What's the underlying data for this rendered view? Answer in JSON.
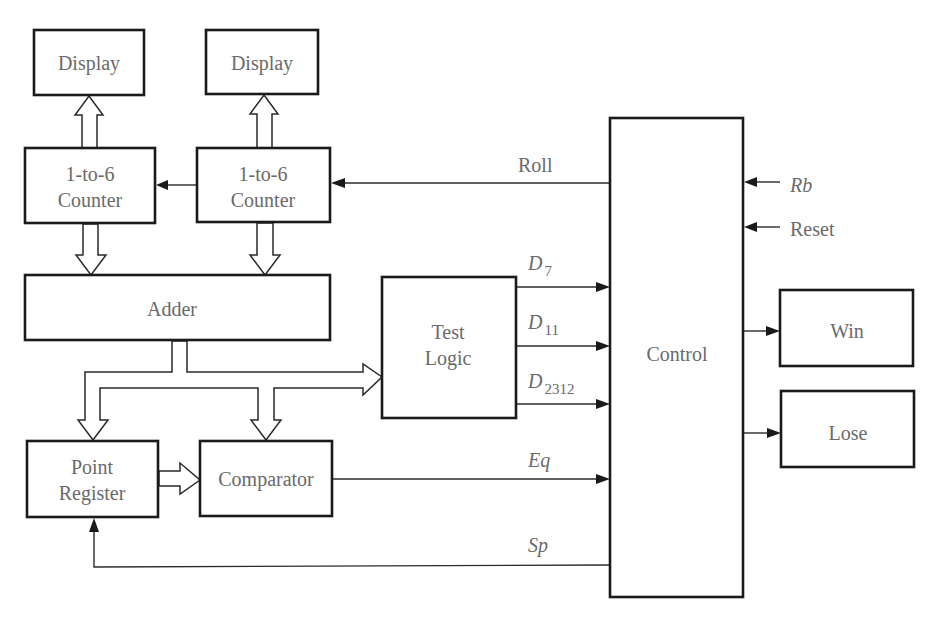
{
  "diagram": {
    "type": "block-diagram",
    "title": "",
    "blocks": {
      "display_left": {
        "label": "Display"
      },
      "display_right": {
        "label": "Display"
      },
      "counter_left": {
        "line1": "1-to-6",
        "line2": "Counter"
      },
      "counter_right": {
        "line1": "1-to-6",
        "line2": "Counter"
      },
      "adder": {
        "label": "Adder"
      },
      "test_logic": {
        "line1": "Test",
        "line2": "Logic"
      },
      "control": {
        "label": "Control"
      },
      "point_register": {
        "line1": "Point",
        "line2": "Register"
      },
      "comparator": {
        "label": "Comparator"
      },
      "win": {
        "label": "Win"
      },
      "lose": {
        "label": "Lose"
      }
    },
    "signals": {
      "roll": {
        "label": "Roll"
      },
      "rb": {
        "label": "Rb"
      },
      "reset": {
        "label": "Reset"
      },
      "d7": {
        "base": "D",
        "sub": "7"
      },
      "d11": {
        "base": "D",
        "sub": "11"
      },
      "d2312": {
        "base": "D",
        "sub": "2312"
      },
      "eq": {
        "label": "Eq"
      },
      "sp": {
        "label": "Sp"
      }
    },
    "connections": [
      {
        "from": "counter_left",
        "to": "display_left",
        "kind": "bus"
      },
      {
        "from": "counter_right",
        "to": "display_right",
        "kind": "bus"
      },
      {
        "from": "counter_right",
        "to": "counter_left",
        "kind": "wire"
      },
      {
        "from": "control",
        "to": "counter_right",
        "kind": "wire",
        "signal": "Roll"
      },
      {
        "from": "counter_left",
        "to": "adder",
        "kind": "bus"
      },
      {
        "from": "counter_right",
        "to": "adder",
        "kind": "bus"
      },
      {
        "from": "adder",
        "to": "test_logic",
        "kind": "bus"
      },
      {
        "from": "adder",
        "to": "point_register",
        "kind": "bus"
      },
      {
        "from": "adder",
        "to": "comparator",
        "kind": "bus"
      },
      {
        "from": "point_register",
        "to": "comparator",
        "kind": "bus"
      },
      {
        "from": "test_logic",
        "to": "control",
        "kind": "wire",
        "signal": "D7"
      },
      {
        "from": "test_logic",
        "to": "control",
        "kind": "wire",
        "signal": "D11"
      },
      {
        "from": "test_logic",
        "to": "control",
        "kind": "wire",
        "signal": "D2312"
      },
      {
        "from": "comparator",
        "to": "control",
        "kind": "wire",
        "signal": "Eq"
      },
      {
        "from": "control",
        "to": "point_register",
        "kind": "wire",
        "signal": "Sp"
      },
      {
        "from": "external",
        "to": "control",
        "kind": "wire",
        "signal": "Rb"
      },
      {
        "from": "external",
        "to": "control",
        "kind": "wire",
        "signal": "Reset"
      },
      {
        "from": "control",
        "to": "win",
        "kind": "wire"
      },
      {
        "from": "control",
        "to": "lose",
        "kind": "wire"
      }
    ]
  }
}
